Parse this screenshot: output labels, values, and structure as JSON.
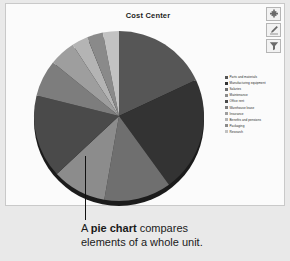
{
  "panel": {
    "title": "Cost Center"
  },
  "toolbar": {
    "add_label": "Add",
    "edit_label": "Edit",
    "filter_label": "Filter",
    "icons": [
      "plus-icon",
      "pencil-icon",
      "filter-icon"
    ]
  },
  "caption": {
    "line1_prefix": "A ",
    "line1_bold": "pie chart",
    "line1_suffix": " compares",
    "line2": "elements of a whole unit.",
    "full_text": "A pie chart compares elements of a whole unit."
  },
  "colors": {
    "page_background": "#e9e9e9",
    "panel_background": "#fbfbfb",
    "panel_border": "#c9c9c9",
    "title_text": "#1c1c1c",
    "callout_line": "#111111",
    "pie_rim": "#1b1b1b"
  },
  "chart_data": {
    "type": "pie",
    "title": "Cost Center",
    "xlabel": "",
    "ylabel": "",
    "legend_position": "right",
    "grid": false,
    "start_angle_deg": 0,
    "direction": "clockwise",
    "categories": [
      "Parts and materials",
      "Manufacturing equipment",
      "Salaries",
      "Maintenance",
      "Office rent",
      "Warehouse lease",
      "Insurance",
      "Benefits and pensions",
      "Packaging",
      "Research"
    ],
    "values": [
      18,
      22,
      13,
      10,
      16,
      7,
      5,
      3,
      3,
      3
    ],
    "units": "percent",
    "slices": [
      {
        "label": "Parts and materials",
        "value": 18,
        "color": "#565656",
        "start_deg": 0,
        "end_deg": 65
      },
      {
        "label": "Manufacturing equipment",
        "value": 22,
        "color": "#333333",
        "start_deg": 65,
        "end_deg": 144
      },
      {
        "label": "Salaries",
        "value": 13,
        "color": "#6f6f6f",
        "start_deg": 144,
        "end_deg": 190
      },
      {
        "label": "Maintenance",
        "value": 10,
        "color": "#8c8c8c",
        "start_deg": 190,
        "end_deg": 227
      },
      {
        "label": "Office rent",
        "value": 16,
        "color": "#4a4a4a",
        "start_deg": 227,
        "end_deg": 284
      },
      {
        "label": "Warehouse lease",
        "value": 7,
        "color": "#7d7d7d",
        "start_deg": 284,
        "end_deg": 309
      },
      {
        "label": "Insurance",
        "value": 5,
        "color": "#9e9e9e",
        "start_deg": 309,
        "end_deg": 327
      },
      {
        "label": "Benefits and pensions",
        "value": 3,
        "color": "#b4b4b4",
        "start_deg": 327,
        "end_deg": 338
      },
      {
        "label": "Packaging",
        "value": 3,
        "color": "#8a8a8a",
        "start_deg": 338,
        "end_deg": 349
      },
      {
        "label": "Research",
        "value": 3,
        "color": "#c2c2c2",
        "start_deg": 349,
        "end_deg": 360
      }
    ],
    "legend": [
      {
        "label": "Parts and materials",
        "color": "#565656"
      },
      {
        "label": "Manufacturing equipment",
        "color": "#333333"
      },
      {
        "label": "Salaries",
        "color": "#6f6f6f"
      },
      {
        "label": "Maintenance",
        "color": "#8c8c8c"
      },
      {
        "label": "Office rent",
        "color": "#4a4a4a"
      },
      {
        "label": "Warehouse lease",
        "color": "#7d7d7d"
      },
      {
        "label": "Insurance",
        "color": "#9e9e9e"
      },
      {
        "label": "Benefits and pensions",
        "color": "#b4b4b4"
      },
      {
        "label": "Packaging",
        "color": "#8a8a8a"
      },
      {
        "label": "Research",
        "color": "#c2c2c2"
      }
    ]
  }
}
